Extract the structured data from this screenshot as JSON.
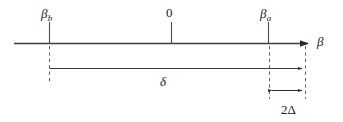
{
  "figure": {
    "type": "number-line-diagram",
    "axis": {
      "name": "beta-axis",
      "label": "β",
      "arrow_direction": "right",
      "start_x": 14,
      "end_x": 310,
      "y": 43
    },
    "ticks": [
      {
        "name": "tick-beta-b",
        "symbol": "β",
        "subscript": "b",
        "x": 49
      },
      {
        "name": "tick-zero",
        "symbol": "0",
        "subscript": "",
        "x": 171
      },
      {
        "name": "tick-beta-a",
        "symbol": "β",
        "subscript": "a",
        "x": 268
      }
    ],
    "measures": [
      {
        "name": "delta-span",
        "label": "δ",
        "from_x": 49,
        "to_x": 305,
        "y": 68,
        "arrowheads": "right"
      },
      {
        "name": "two-delta-span",
        "label": "2Δ",
        "from_x": 269,
        "to_x": 304,
        "y": 90,
        "arrowheads": "both"
      }
    ],
    "guides": [
      {
        "name": "guide-beta-b",
        "x": 49,
        "from_y": 46,
        "to_y": 82
      },
      {
        "name": "guide-beta-a",
        "x": 269,
        "from_y": 46,
        "to_y": 98
      },
      {
        "name": "guide-right",
        "x": 305,
        "from_y": 46,
        "to_y": 98
      }
    ],
    "colors": {
      "ink": "#1a1a1a",
      "line": "#4a4a4a",
      "guide": "#6a6a6a",
      "background": "#ffffff"
    }
  }
}
